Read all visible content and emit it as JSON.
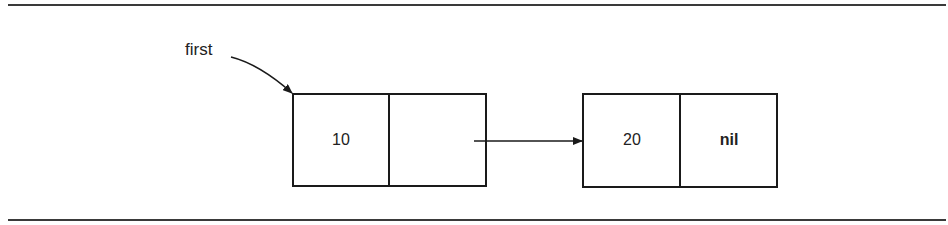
{
  "diagram": {
    "type": "linked-list",
    "pointer_label": "first",
    "nodes": [
      {
        "value": "10",
        "next": ""
      },
      {
        "value": "20",
        "next": "nil"
      }
    ],
    "colors": {
      "line": "#1a1a1a",
      "background": "#ffffff"
    }
  }
}
